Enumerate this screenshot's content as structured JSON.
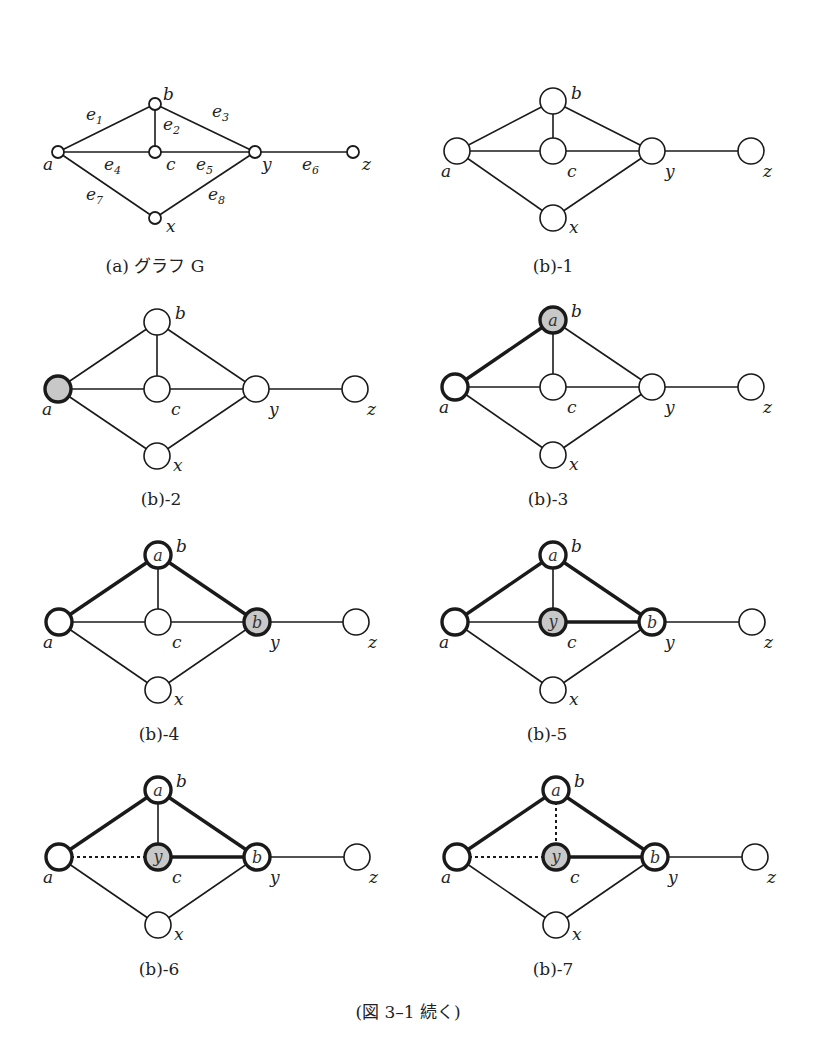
{
  "figure_caption": "(図 3–1 続く)",
  "colors": {
    "line": "#1a1a1a",
    "node_fill": "#ffffff",
    "visited_fill": "#c8c8c8"
  },
  "graph": {
    "vertices": [
      "a",
      "b",
      "c",
      "x",
      "y",
      "z"
    ],
    "edges": [
      {
        "id": "e1",
        "from": "a",
        "to": "b"
      },
      {
        "id": "e2",
        "from": "b",
        "to": "c"
      },
      {
        "id": "e3",
        "from": "b",
        "to": "y"
      },
      {
        "id": "e4",
        "from": "a",
        "to": "c"
      },
      {
        "id": "e5",
        "from": "c",
        "to": "y"
      },
      {
        "id": "e6",
        "from": "y",
        "to": "z"
      },
      {
        "id": "e7",
        "from": "a",
        "to": "x"
      },
      {
        "id": "e8",
        "from": "x",
        "to": "y"
      }
    ]
  },
  "panels": [
    {
      "id": "a",
      "caption": "(a) グラフ G",
      "edge_labels": [
        {
          "text": "e",
          "sub": "1"
        },
        {
          "text": "e",
          "sub": "2"
        },
        {
          "text": "e",
          "sub": "3"
        },
        {
          "text": "e",
          "sub": "4"
        },
        {
          "text": "e",
          "sub": "5"
        },
        {
          "text": "e",
          "sub": "6"
        },
        {
          "text": "e",
          "sub": "7"
        },
        {
          "text": "e",
          "sub": "8"
        }
      ],
      "vertex_labels": {
        "a": "a",
        "b": "b",
        "c": "c",
        "x": "x",
        "y": "y",
        "z": "z"
      }
    },
    {
      "id": "b1",
      "caption": "(b)-1",
      "vertex_labels": {
        "a": "a",
        "b": "b",
        "c": "c",
        "x": "x",
        "y": "y",
        "z": "z"
      },
      "thick_nodes": [],
      "current": null,
      "thick_edges": [],
      "dotted_edges": [],
      "inner_labels": {}
    },
    {
      "id": "b2",
      "caption": "(b)-2",
      "vertex_labels": {
        "a": "a",
        "b": "b",
        "c": "c",
        "x": "x",
        "y": "y",
        "z": "z"
      },
      "thick_nodes": [
        "a"
      ],
      "current": "a",
      "thick_edges": [],
      "dotted_edges": [],
      "inner_labels": {}
    },
    {
      "id": "b3",
      "caption": "(b)-3",
      "vertex_labels": {
        "a": "a",
        "b": "b",
        "c": "c",
        "x": "x",
        "y": "y",
        "z": "z"
      },
      "thick_nodes": [
        "a",
        "b"
      ],
      "current": "b",
      "thick_edges": [
        "e1"
      ],
      "dotted_edges": [],
      "inner_labels": {
        "b": "a"
      }
    },
    {
      "id": "b4",
      "caption": "(b)-4",
      "vertex_labels": {
        "a": "a",
        "b": "b",
        "c": "c",
        "x": "x",
        "y": "y",
        "z": "z"
      },
      "thick_nodes": [
        "a",
        "b",
        "y"
      ],
      "current": "y",
      "thick_edges": [
        "e1",
        "e3"
      ],
      "dotted_edges": [],
      "inner_labels": {
        "b": "a",
        "y": "b"
      }
    },
    {
      "id": "b5",
      "caption": "(b)-5",
      "vertex_labels": {
        "a": "a",
        "b": "b",
        "c": "c",
        "x": "x",
        "y": "y",
        "z": "z"
      },
      "thick_nodes": [
        "a",
        "b",
        "y",
        "c"
      ],
      "current": "c",
      "thick_edges": [
        "e1",
        "e3",
        "e5"
      ],
      "dotted_edges": [],
      "inner_labels": {
        "b": "a",
        "y": "b",
        "c": "y"
      }
    },
    {
      "id": "b6",
      "caption": "(b)-6",
      "vertex_labels": {
        "a": "a",
        "b": "b",
        "c": "c",
        "x": "x",
        "y": "y",
        "z": "z"
      },
      "thick_nodes": [
        "a",
        "b",
        "y",
        "c"
      ],
      "current": "c",
      "thick_edges": [
        "e1",
        "e3",
        "e5"
      ],
      "dotted_edges": [
        "e4"
      ],
      "inner_labels": {
        "b": "a",
        "y": "b",
        "c": "y"
      }
    },
    {
      "id": "b7",
      "caption": "(b)-7",
      "vertex_labels": {
        "a": "a",
        "b": "b",
        "c": "c",
        "x": "x",
        "y": "y",
        "z": "z"
      },
      "thick_nodes": [
        "a",
        "b",
        "y",
        "c"
      ],
      "current": "c",
      "thick_edges": [
        "e1",
        "e3",
        "e5"
      ],
      "dotted_edges": [
        "e4",
        "e2"
      ],
      "inner_labels": {
        "b": "a",
        "y": "b",
        "c": "y"
      }
    }
  ]
}
